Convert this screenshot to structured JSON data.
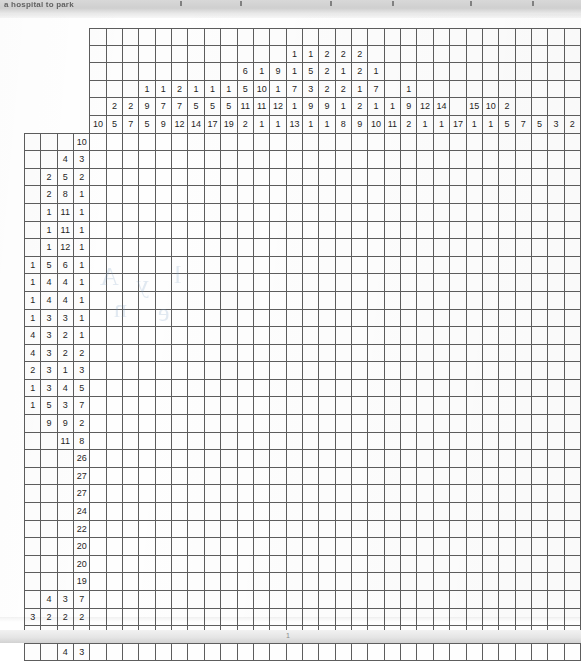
{
  "document": {
    "kind": "nonogram-puzzle",
    "top_text": "a hospital to park",
    "page_number": "1"
  },
  "puzzle": {
    "grid_columns": 30,
    "grid_rows": 30,
    "clue_header_rows": 6,
    "clue_header_cols": 4,
    "ink_color": "#1f1f1f",
    "line_color": "#5d5d5d",
    "column_clues": [
      [
        10
      ],
      [
        2,
        5
      ],
      [
        2,
        7
      ],
      [
        1,
        9,
        5
      ],
      [
        1,
        7,
        9
      ],
      [
        2,
        7,
        12
      ],
      [
        1,
        5,
        14
      ],
      [
        1,
        5,
        17
      ],
      [
        1,
        5,
        19
      ],
      [
        6,
        5,
        11,
        2
      ],
      [
        1,
        10,
        11,
        1
      ],
      [
        9,
        1,
        12,
        1
      ],
      [
        1,
        1,
        7,
        1,
        13
      ],
      [
        1,
        5,
        3,
        9,
        1
      ],
      [
        2,
        2,
        2,
        9,
        1
      ],
      [
        2,
        1,
        2,
        1,
        8
      ],
      [
        2,
        2,
        1,
        2,
        9
      ],
      [
        1,
        7,
        1,
        10
      ],
      [
        1,
        11
      ],
      [
        1,
        9,
        2
      ],
      [
        12,
        1
      ],
      [
        14,
        1
      ],
      [
        17
      ],
      [
        15,
        1
      ],
      [
        10,
        1
      ],
      [
        2,
        5
      ],
      [
        7
      ],
      [
        5
      ],
      [
        3
      ],
      [
        2
      ]
    ],
    "row_clues": [
      [
        10
      ],
      [
        4,
        3
      ],
      [
        2,
        5,
        2
      ],
      [
        2,
        8,
        1
      ],
      [
        1,
        11,
        1
      ],
      [
        1,
        11,
        1
      ],
      [
        1,
        12,
        1
      ],
      [
        1,
        5,
        6,
        1
      ],
      [
        1,
        4,
        4,
        1
      ],
      [
        1,
        4,
        4,
        1
      ],
      [
        1,
        3,
        3,
        1
      ],
      [
        4,
        3,
        2,
        1
      ],
      [
        4,
        3,
        2,
        2
      ],
      [
        2,
        3,
        1,
        3
      ],
      [
        1,
        3,
        4,
        5
      ],
      [
        1,
        5,
        3,
        7
      ],
      [
        9,
        9,
        2
      ],
      [
        11,
        8
      ],
      [
        26
      ],
      [
        27
      ],
      [
        27
      ],
      [
        24
      ],
      [
        22
      ],
      [
        20
      ],
      [
        20
      ],
      [
        19
      ],
      [
        4,
        3,
        7
      ],
      [
        3,
        2,
        2,
        2
      ],
      [
        3,
        3,
        2,
        3
      ],
      [
        4,
        3
      ]
    ]
  }
}
